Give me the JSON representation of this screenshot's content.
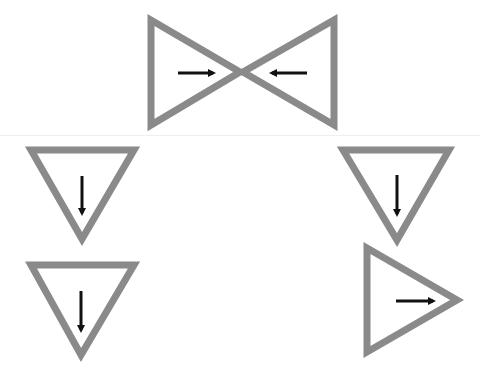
{
  "diagram": {
    "background": "#ffffff",
    "stroke_color": "#8a8a8a",
    "arrow_color": "#111111",
    "separator_color": "#efefef",
    "stroke_width": 7,
    "triangles": [
      {
        "id": "bowtie-left",
        "points": [
          [
            151,
            20
          ],
          [
            151,
            125
          ],
          [
            240,
            72
          ]
        ],
        "direction": "right",
        "arrow": {
          "x1": 178,
          "y1": 73,
          "x2": 213,
          "y2": 73
        }
      },
      {
        "id": "bowtie-right",
        "points": [
          [
            334,
            20
          ],
          [
            334,
            125
          ],
          [
            243,
            72
          ]
        ],
        "direction": "left",
        "arrow": {
          "x1": 307,
          "y1": 73,
          "x2": 272,
          "y2": 73
        }
      },
      {
        "id": "middle-left",
        "points": [
          [
            31,
            150
          ],
          [
            134,
            150
          ],
          [
            82,
            239
          ]
        ],
        "direction": "down",
        "arrow": {
          "x1": 82,
          "y1": 176,
          "x2": 82,
          "y2": 213
        }
      },
      {
        "id": "middle-right",
        "points": [
          [
            343,
            150
          ],
          [
            449,
            150
          ],
          [
            397,
            240
          ]
        ],
        "direction": "down",
        "arrow": {
          "x1": 397,
          "y1": 175,
          "x2": 397,
          "y2": 214
        }
      },
      {
        "id": "bottom-left",
        "points": [
          [
            31,
            265
          ],
          [
            134,
            265
          ],
          [
            81,
            355
          ]
        ],
        "direction": "down",
        "arrow": {
          "x1": 81,
          "y1": 291,
          "x2": 81,
          "y2": 330
        }
      },
      {
        "id": "bottom-right",
        "points": [
          [
            367,
            248
          ],
          [
            367,
            352
          ],
          [
            457,
            300
          ]
        ],
        "direction": "right",
        "arrow": {
          "x1": 396,
          "y1": 301,
          "x2": 433,
          "y2": 301
        }
      }
    ]
  }
}
